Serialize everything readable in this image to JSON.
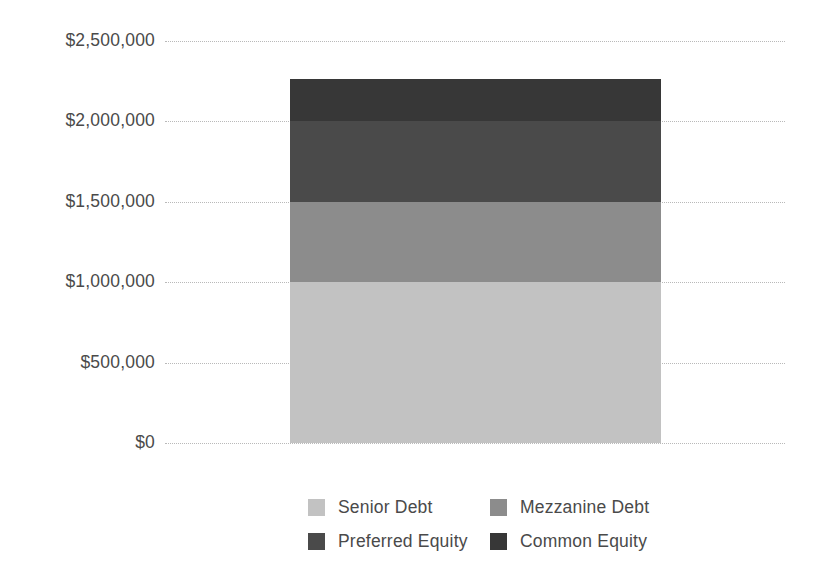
{
  "chart_data": {
    "type": "bar",
    "subtype": "stacked-column-single",
    "title": "",
    "subtitle": "",
    "xlabel": "",
    "ylabel": "",
    "categories": [
      ""
    ],
    "ylim": [
      0,
      2500000
    ],
    "ytick_values": [
      0,
      500000,
      1000000,
      1500000,
      2000000,
      2500000
    ],
    "ytick_labels": [
      "$0",
      "$500,000",
      "$1,000,000",
      "$1,500,000",
      "$2,000,000",
      "$2,500,000"
    ],
    "grid": true,
    "grid_style": "dotted",
    "grid_axis": "y",
    "legend_position": "bottom",
    "total": 2265000,
    "series": [
      {
        "name": "Senior Debt",
        "value": 1000000,
        "start": 0,
        "end": 1000000,
        "color": "#c2c2c2"
      },
      {
        "name": "Mezzanine Debt",
        "value": 500000,
        "start": 1000000,
        "end": 1500000,
        "color": "#8c8c8c"
      },
      {
        "name": "Preferred Equity",
        "value": 500000,
        "start": 1500000,
        "end": 2000000,
        "color": "#4a4a4a"
      },
      {
        "name": "Common Equity",
        "value": 265000,
        "start": 2000000,
        "end": 2265000,
        "color": "#373737"
      }
    ]
  },
  "axis": {
    "ticks": [
      {
        "label": "$2,500,000",
        "value": 2500000
      },
      {
        "label": "$2,000,000",
        "value": 2000000
      },
      {
        "label": "$1,500,000",
        "value": 1500000
      },
      {
        "label": "$1,000,000",
        "value": 1000000
      },
      {
        "label": "$500,000",
        "value": 500000
      },
      {
        "label": "$0",
        "value": 0
      }
    ]
  },
  "legend": {
    "items": [
      {
        "label": "Senior Debt",
        "color": "#c2c2c2"
      },
      {
        "label": "Mezzanine Debt",
        "color": "#8c8c8c"
      },
      {
        "label": "Preferred Equity",
        "color": "#4a4a4a"
      },
      {
        "label": "Common Equity",
        "color": "#373737"
      }
    ]
  },
  "style": {
    "background": "#ffffff",
    "text_color": "#4a4a4a",
    "gridline_color": "#b9b9b9"
  }
}
